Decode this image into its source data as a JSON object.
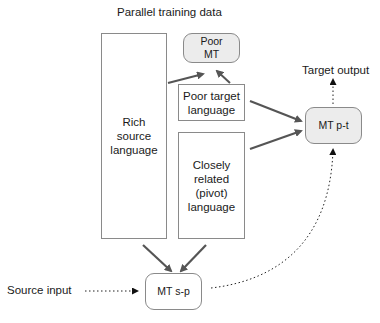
{
  "title": "Parallel training data",
  "boxes": {
    "rich_source": "Rich source language",
    "poor_target": "Poor target language",
    "pivot": "Closely related (pivot) language"
  },
  "nodes": {
    "poor_mt": "Poor MT",
    "mt_pt": "MT p-t",
    "mt_sp": "MT s-p"
  },
  "labels": {
    "target_output": "Target output",
    "source_input": "Source input"
  },
  "colors": {
    "arrow": "#555555",
    "box_border": "#8a8a8a",
    "node_fill": "#ececec"
  }
}
